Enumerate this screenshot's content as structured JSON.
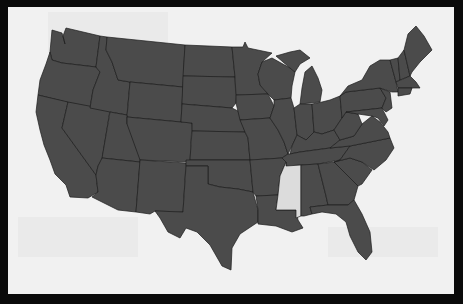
{
  "map": {
    "title": "",
    "region": "United States (contiguous)",
    "colors": {
      "frame": "#0a0a0a",
      "background": "#f1f1f1",
      "default_state": "#4b4b4b",
      "highlighted_state": "#dcdcdc",
      "border": "#1c1c1c"
    },
    "highlighted": [
      "Mississippi"
    ]
  }
}
